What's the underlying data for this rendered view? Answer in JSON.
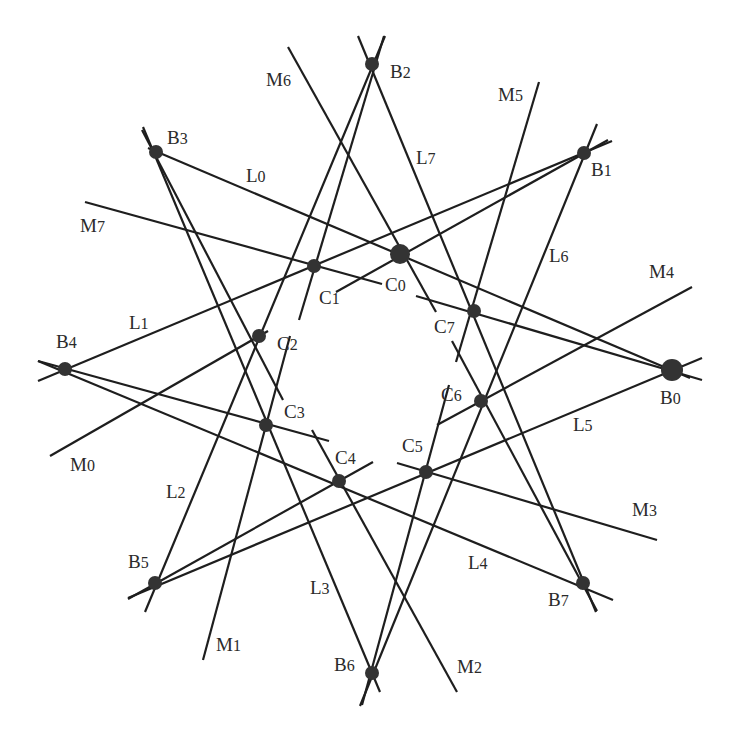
{
  "diagram": {
    "type": "geometric-configuration",
    "colors": {
      "line": "#1e1e1e",
      "dot": "#333333",
      "label": "#2a2a2a",
      "background": "#ffffff"
    },
    "B_points": [
      {
        "id": "B0",
        "label": "B0",
        "x": 672,
        "y": 370,
        "r": 11,
        "lx": 660,
        "ly": 388
      },
      {
        "id": "B1",
        "label": "B1",
        "x": 584,
        "y": 153,
        "r": 7,
        "lx": 591,
        "ly": 160
      },
      {
        "id": "B2",
        "label": "B2",
        "x": 372,
        "y": 64,
        "r": 7,
        "lx": 390,
        "ly": 62
      },
      {
        "id": "B3",
        "label": "B3",
        "x": 156,
        "y": 152,
        "r": 7,
        "lx": 167,
        "ly": 128
      },
      {
        "id": "B4",
        "label": "B4",
        "x": 65,
        "y": 369,
        "r": 7,
        "lx": 56,
        "ly": 332
      },
      {
        "id": "B5",
        "label": "B5",
        "x": 155,
        "y": 583,
        "r": 7,
        "lx": 128,
        "ly": 552
      },
      {
        "id": "B6",
        "label": "B6",
        "x": 372,
        "y": 673,
        "r": 7,
        "lx": 334,
        "ly": 655
      },
      {
        "id": "B7",
        "label": "B7",
        "x": 583,
        "y": 583,
        "r": 7,
        "lx": 548,
        "ly": 590
      }
    ],
    "inner_points": [
      {
        "id": "P0",
        "x": 400,
        "y": 254,
        "r": 10
      },
      {
        "id": "P1",
        "x": 314,
        "y": 266,
        "r": 7
      },
      {
        "id": "P2",
        "x": 259,
        "y": 336,
        "r": 7
      },
      {
        "id": "P3",
        "x": 266,
        "y": 425,
        "r": 7
      },
      {
        "id": "P4",
        "x": 339,
        "y": 481,
        "r": 7
      },
      {
        "id": "P5",
        "x": 426,
        "y": 472,
        "r": 7
      },
      {
        "id": "P6",
        "x": 481,
        "y": 401,
        "r": 7
      },
      {
        "id": "P7",
        "x": 474,
        "y": 311,
        "r": 7
      }
    ],
    "C_labels": [
      {
        "label": "C0",
        "lx": 385,
        "ly": 275
      },
      {
        "label": "C1",
        "lx": 319,
        "ly": 288
      },
      {
        "label": "C2",
        "lx": 277,
        "ly": 334
      },
      {
        "label": "C3",
        "lx": 284,
        "ly": 402
      },
      {
        "label": "C4",
        "lx": 335,
        "ly": 448
      },
      {
        "label": "C5",
        "lx": 402,
        "ly": 436
      },
      {
        "label": "C6",
        "lx": 441,
        "ly": 385
      },
      {
        "label": "C7",
        "lx": 434,
        "ly": 317
      }
    ],
    "L_lines": [
      {
        "label": "L0",
        "from": [
          148,
          148
        ],
        "to": [
          690,
          378
        ],
        "lx": 246,
        "ly": 166
      },
      {
        "label": "L1",
        "from": [
          38,
          381
        ],
        "to": [
          612,
          141
        ],
        "lx": 129,
        "ly": 313
      },
      {
        "label": "L2",
        "from": [
          145,
          612
        ],
        "to": [
          385,
          36
        ],
        "lx": 166,
        "ly": 482
      },
      {
        "label": "L3",
        "from": [
          380,
          692
        ],
        "to": [
          143,
          127
        ],
        "lx": 310,
        "ly": 578
      },
      {
        "label": "L4",
        "from": [
          613,
          600
        ],
        "to": [
          38,
          361
        ],
        "lx": 468,
        "ly": 553
      },
      {
        "label": "L5",
        "from": [
          702,
          358
        ],
        "to": [
          128,
          598
        ],
        "lx": 573,
        "ly": 415
      },
      {
        "label": "L6",
        "from": [
          597,
          124
        ],
        "to": [
          360,
          706
        ],
        "lx": 549,
        "ly": 246
      },
      {
        "label": "L7",
        "from": [
          358,
          36
        ],
        "to": [
          596,
          612
        ],
        "lx": 416,
        "ly": 148
      }
    ],
    "M_lines": [
      {
        "label": "M0",
        "segments": [
          [
            [
              50,
              456
            ],
            [
              268,
              331
            ]
          ],
          [
            [
              336,
              292
            ],
            [
              608,
              140
            ]
          ]
        ],
        "lx": 70,
        "ly": 455
      },
      {
        "label": "M1",
        "segments": [
          [
            [
              203,
              660
            ],
            [
              290,
              336
            ]
          ],
          [
            [
              299,
              320
            ],
            [
              384,
              36
            ]
          ]
        ],
        "lx": 216,
        "ly": 635
      },
      {
        "label": "M2",
        "segments": [
          [
            [
              457,
              692
            ],
            [
              312,
              430
            ]
          ],
          [
            [
              283,
              400
            ],
            [
              142,
              130
            ]
          ]
        ],
        "lx": 457,
        "ly": 657
      },
      {
        "label": "M3",
        "segments": [
          [
            [
              657,
              540
            ],
            [
              397,
              463
            ]
          ],
          [
            [
              329,
              441
            ],
            [
              38,
              361
            ]
          ]
        ],
        "lx": 632,
        "ly": 500
      },
      {
        "label": "M4",
        "segments": [
          [
            [
              692,
              287
            ],
            [
              437,
              425
            ]
          ],
          [
            [
              373,
              462
            ],
            [
              128,
              599
            ]
          ]
        ],
        "lx": 649,
        "ly": 262
      },
      {
        "label": "M5",
        "segments": [
          [
            [
              539,
              82
            ],
            [
              456,
              362
            ]
          ],
          [
            [
              449,
              385
            ],
            [
              362,
              705
            ]
          ]
        ],
        "lx": 498,
        "ly": 85
      },
      {
        "label": "M6",
        "segments": [
          [
            [
              288,
              47
            ],
            [
              436,
              312
            ]
          ],
          [
            [
              452,
              341
            ],
            [
              597,
              611
            ]
          ]
        ],
        "lx": 266,
        "ly": 70
      },
      {
        "label": "M7",
        "segments": [
          [
            [
              85,
              202
            ],
            [
              382,
              284
            ]
          ],
          [
            [
              416,
              296
            ],
            [
              702,
              380
            ]
          ]
        ],
        "lx": 80,
        "ly": 216
      }
    ]
  }
}
